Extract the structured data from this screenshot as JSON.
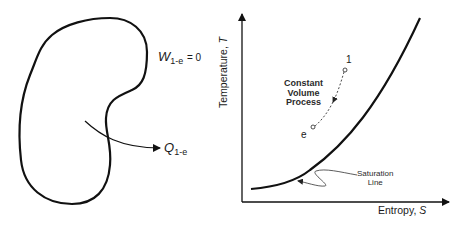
{
  "left_panel": {
    "work_label": {
      "symbol": "W",
      "subscript": "1-e",
      "equation": "= 0"
    },
    "heat_label": {
      "symbol": "Q",
      "subscript": "1-e"
    },
    "shape": "closed-system-boundary"
  },
  "right_panel": {
    "y_axis_label": {
      "text": "Temperature, ",
      "variable": "T"
    },
    "x_axis_label": {
      "text": "Entropy, ",
      "variable": "S"
    },
    "process_label": [
      "Constant",
      "Volume",
      "Process"
    ],
    "point_start": "1",
    "point_end": "e",
    "saturation_label": [
      "Saturation",
      "Line"
    ]
  },
  "colors": {
    "stroke": "#111111",
    "background": "#ffffff"
  }
}
